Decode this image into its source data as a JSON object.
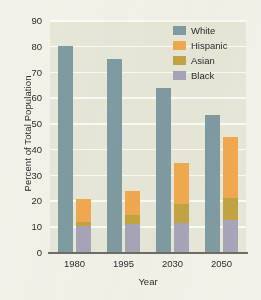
{
  "chart_data": {
    "type": "bar",
    "title": "",
    "xlabel": "Year",
    "ylabel": "Percent of Total Population",
    "categories": [
      "1980",
      "1995",
      "2030",
      "2050"
    ],
    "ylim": [
      0,
      90
    ],
    "yticks": [
      0,
      10,
      20,
      30,
      40,
      50,
      60,
      70,
      80,
      90
    ],
    "grid": true,
    "legend_position": "top-right",
    "stacked_minority_bar": true,
    "series": [
      {
        "name": "White",
        "color": "#7f9ba2",
        "values": [
          80,
          75,
          63.5,
          53
        ]
      },
      {
        "name": "Hispanic",
        "color": "#f0a94f",
        "values": [
          9,
          9,
          16,
          23.5
        ]
      },
      {
        "name": "Asian",
        "color": "#c3a443",
        "values": [
          1.5,
          3.7,
          7.2,
          8.5
        ]
      },
      {
        "name": "Black",
        "color": "#a8a4b9",
        "values": [
          10,
          10.8,
          11.3,
          12.5
        ]
      }
    ],
    "stack_tops": [
      20.5,
      23.5,
      34.5,
      44.5
    ]
  },
  "axes": {
    "y_title": "Percent of Total Population",
    "x_title": "Year",
    "y_tick_labels": [
      "90",
      "80",
      "70",
      "60",
      "50",
      "40",
      "30",
      "20",
      "10",
      "0"
    ],
    "x_tick_labels": [
      "1980",
      "1995",
      "2030",
      "2050"
    ]
  },
  "legend": {
    "items": [
      {
        "label": "White",
        "color": "#7f9ba2"
      },
      {
        "label": "Hispanic",
        "color": "#f0a94f"
      },
      {
        "label": "Asian",
        "color": "#c3a443"
      },
      {
        "label": "Black",
        "color": "#a8a4b9"
      }
    ]
  },
  "colors": {
    "plot_background": "#e7e7d9",
    "page_background": "#f3f2ea",
    "gridline": "#fbfbf5",
    "axis_line": "#6d6d63",
    "text": "#2b2b2b"
  }
}
